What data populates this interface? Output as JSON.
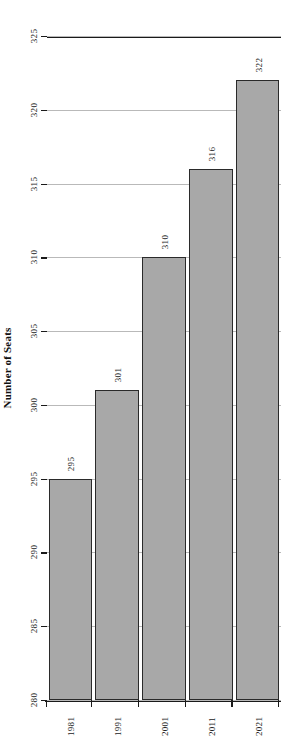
{
  "chart_data": {
    "type": "bar",
    "orientation": "horizontal",
    "title": "",
    "subtitle": "",
    "xlabel": "",
    "ylabel": "Number of Seats",
    "value_axis_label": "Number of Seats",
    "categories": [
      "1981",
      "1991",
      "2001",
      "2011",
      "2021"
    ],
    "values": [
      295,
      301,
      310,
      316,
      322
    ],
    "data_labels": [
      "295",
      "301",
      "310",
      "316",
      "322"
    ],
    "series": [
      {
        "name": "Number of Seats",
        "values": [
          295,
          301,
          310,
          316,
          322
        ]
      }
    ],
    "value_axis": {
      "min": 280,
      "max": 325,
      "ticks": [
        325,
        320,
        315,
        310,
        305,
        300,
        295,
        290,
        285,
        280
      ],
      "tick_labels": [
        "325",
        "320",
        "315",
        "310",
        "305",
        "300",
        "295",
        "290",
        "285",
        "280"
      ],
      "inverted": true,
      "baseline": 280
    },
    "grid": true,
    "legend": null,
    "legend_position": "none",
    "bar_color": "#a8a8a8",
    "bar_edge_color": "#2a2a2a",
    "grid_color": "#b9b9b9",
    "axis_color": "#1a1a1a",
    "rotation_deg": 90
  }
}
